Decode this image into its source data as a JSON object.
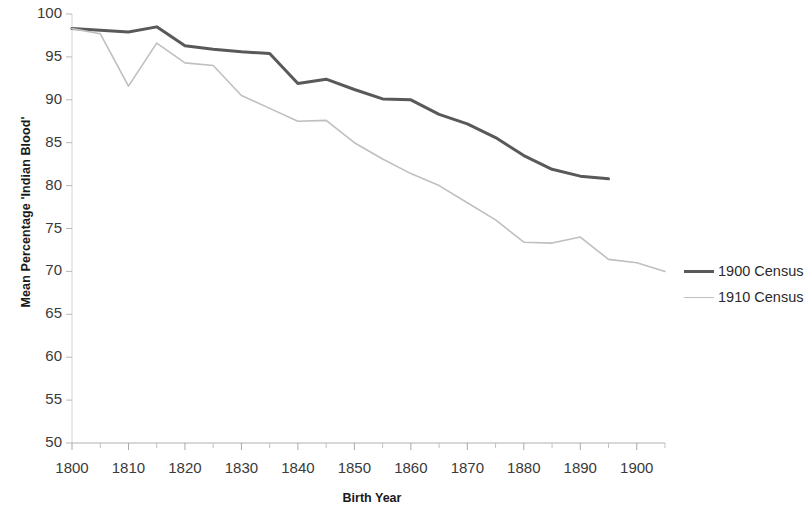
{
  "chart_data": {
    "type": "line",
    "title": "",
    "xlabel": "Birth Year",
    "ylabel": "Mean Percentage 'Indian Blood'",
    "xlim": [
      1800,
      1905
    ],
    "ylim": [
      50,
      100
    ],
    "y_ticks": [
      50,
      55,
      60,
      65,
      70,
      75,
      80,
      85,
      90,
      95,
      100
    ],
    "y_tick_labels": [
      "50",
      "55",
      "60",
      "65",
      "70",
      "75",
      "80",
      "85",
      "90",
      "95",
      "100"
    ],
    "x_ticks": [
      1800,
      1810,
      1820,
      1830,
      1840,
      1850,
      1860,
      1870,
      1880,
      1890,
      1900
    ],
    "x_tick_labels": [
      "1800",
      "1810",
      "1820",
      "1830",
      "1840",
      "1850",
      "1860",
      "1870",
      "1880",
      "1890",
      "1900"
    ],
    "x_minor_tick_step": 5,
    "grid": false,
    "legend_position": "right",
    "series": [
      {
        "name": "1900 Census",
        "color": "#595959",
        "width": 3,
        "x": [
          1800,
          1805,
          1810,
          1815,
          1820,
          1825,
          1830,
          1835,
          1840,
          1845,
          1850,
          1855,
          1860,
          1865,
          1870,
          1875,
          1880,
          1885,
          1890,
          1895
        ],
        "values": [
          98.3,
          98.1,
          97.9,
          98.5,
          96.3,
          95.9,
          95.6,
          95.4,
          91.9,
          92.4,
          91.2,
          90.1,
          90.0,
          88.3,
          87.2,
          85.6,
          83.5,
          81.9,
          81.1,
          80.8
        ]
      },
      {
        "name": "1910 Census",
        "color": "#bfbfbf",
        "width": 1.6,
        "x": [
          1800,
          1805,
          1810,
          1815,
          1820,
          1825,
          1830,
          1835,
          1840,
          1845,
          1850,
          1855,
          1860,
          1865,
          1870,
          1875,
          1880,
          1885,
          1890,
          1895,
          1900,
          1905
        ],
        "values": [
          98.3,
          97.7,
          91.6,
          96.6,
          94.3,
          94.0,
          90.5,
          89.0,
          87.5,
          87.6,
          85.0,
          83.1,
          81.4,
          80.0,
          78.0,
          76.0,
          73.4,
          73.3,
          74.0,
          71.4,
          71.0,
          70.0
        ]
      }
    ]
  },
  "legend": {
    "items": [
      {
        "label": "1900 Census"
      },
      {
        "label": "1910 Census"
      }
    ]
  }
}
